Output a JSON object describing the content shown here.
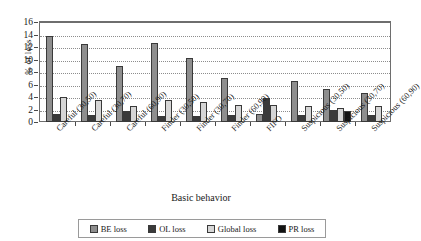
{
  "chart_data": {
    "type": "bar",
    "title": "",
    "xlabel": "Basic behavior",
    "ylabel": "% of loss",
    "ylim": [
      0,
      16
    ],
    "ytick_step": 2,
    "yticks": [
      0,
      2,
      4,
      6,
      8,
      10,
      12,
      14,
      16
    ],
    "grid": true,
    "legend_position": "bottom",
    "categories": [
      "Careful (30,50)",
      "Careful (30,70)",
      "Careful (60,90)",
      "Finder (30,50)",
      "Finder (30,70)",
      "Finder (60,90)",
      "FIFO",
      "Suspicious (30,50)",
      "Suspicious (30,70)",
      "Suspicious (60,90)"
    ],
    "series": [
      {
        "name": "BE loss",
        "color": "#8e8e8e",
        "values": [
          13.8,
          12.5,
          8.9,
          12.7,
          10.3,
          7.0,
          1.3,
          6.5,
          5.3,
          4.6
        ]
      },
      {
        "name": "OL loss",
        "color": "#3a3a3a",
        "values": [
          1.3,
          1.1,
          1.7,
          1.0,
          1.0,
          1.2,
          3.9,
          1.2,
          1.9,
          1.1
        ]
      },
      {
        "name": "Global loss",
        "color": "#d6d6d6",
        "values": [
          4.0,
          3.6,
          2.6,
          3.5,
          3.2,
          2.8,
          2.8,
          2.6,
          2.2,
          2.5
        ]
      },
      {
        "name": "PR loss",
        "color": "#121212",
        "values": [
          0,
          0,
          0,
          0,
          0,
          0,
          0,
          0,
          1.8,
          0
        ]
      }
    ]
  },
  "legend": {
    "items": [
      {
        "label": "BE loss"
      },
      {
        "label": "OL loss"
      },
      {
        "label": "Global loss"
      },
      {
        "label": "PR loss"
      }
    ]
  }
}
